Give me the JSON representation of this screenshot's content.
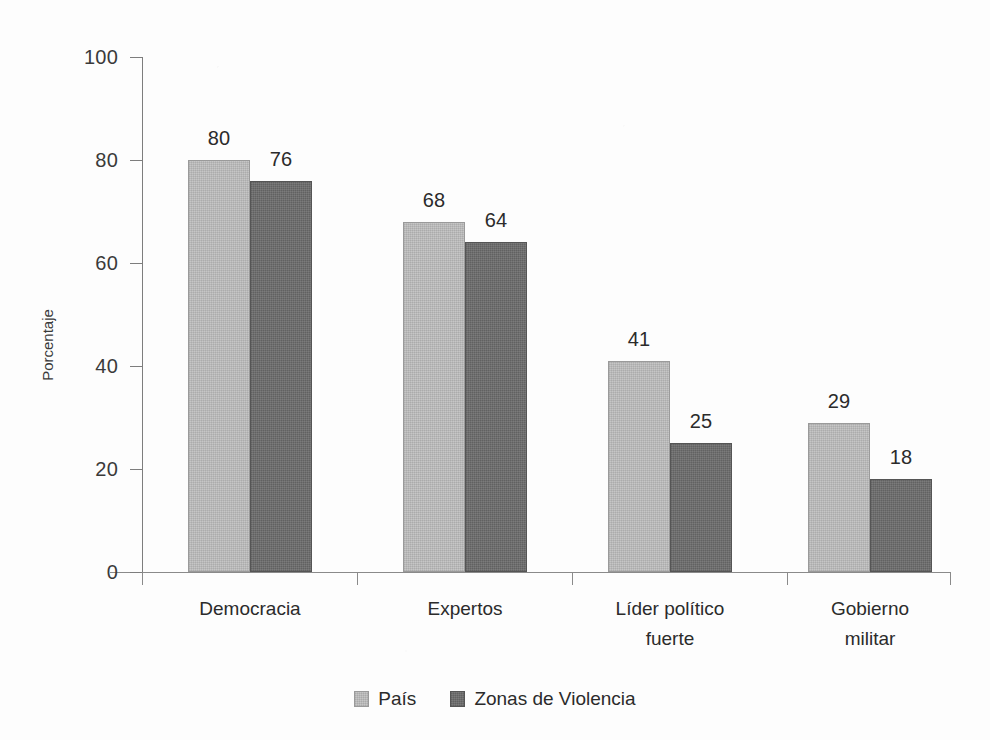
{
  "chart_data": {
    "type": "bar",
    "title": "",
    "subtitle": "",
    "xlabel": "",
    "ylabel": "Porcentaje",
    "ylim": [
      0,
      100
    ],
    "ytick_labels": [
      "100",
      "80",
      "60",
      "40",
      "20",
      "0"
    ],
    "ytick_values": [
      100,
      80,
      60,
      40,
      20,
      0
    ],
    "grid": false,
    "legend_position": "bottom-center",
    "categories": [
      "Democracia",
      "Expertos",
      "Líder político fuerte",
      "Gobierno militar"
    ],
    "category_lines": [
      [
        "Democracia"
      ],
      [
        "Expertos"
      ],
      [
        "Líder político",
        "fuerte"
      ],
      [
        "Gobierno",
        "militar"
      ]
    ],
    "series": [
      {
        "name": "País",
        "color": "#c0c0c0",
        "values": [
          80,
          68,
          41,
          29
        ],
        "labels": [
          "80",
          "68",
          "41",
          "29"
        ]
      },
      {
        "name": "Zonas de Violencia",
        "color": "#6d6d6d",
        "values": [
          76,
          64,
          25,
          18
        ],
        "labels": [
          "76",
          "64",
          "25",
          "18"
        ]
      }
    ]
  },
  "axis": {
    "y_title": "Porcentaje",
    "ticks": [
      {
        "label": "100",
        "value": 100
      },
      {
        "label": "80",
        "value": 80
      },
      {
        "label": "60",
        "value": 60
      },
      {
        "label": "40",
        "value": 40
      },
      {
        "label": "20",
        "value": 20
      },
      {
        "label": "0",
        "value": 0
      }
    ]
  },
  "legend": {
    "items": [
      {
        "label": "País",
        "swatch": "light"
      },
      {
        "label": "Zonas de Violencia",
        "swatch": "dark"
      }
    ]
  },
  "colors": {
    "series_light": "#c0c0c0",
    "series_dark": "#6d6d6d",
    "axis": "#8a8a8a",
    "text": "#2b2b2b",
    "background": "#fdfdfd"
  }
}
